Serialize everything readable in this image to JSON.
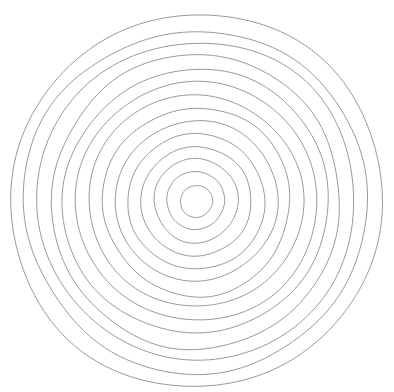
{
  "figure": {
    "background_color": "#ffffff",
    "stroke_color": "#9a9a9a",
    "stroke_width": 1,
    "canvas": {
      "width": 394,
      "height": 392
    }
  },
  "chart_data": {
    "type": "scatter",
    "subtitle": "",
    "xlabel": "",
    "ylabel": "",
    "xlim": [
      0,
      394
    ],
    "ylim": [
      0,
      392
    ],
    "grid": false,
    "legend": false,
    "legend_position": "none",
    "center": {
      "x": 196,
      "y": 201
    },
    "ring_count": 14,
    "radii": [
      16,
      29,
      42,
      55,
      68,
      81,
      94,
      107,
      120,
      133,
      146,
      159,
      172,
      186
    ],
    "roughness": 0.9,
    "series": [
      {
        "name": "rings",
        "values": [
          16,
          29,
          42,
          55,
          68,
          81,
          94,
          107,
          120,
          133,
          146,
          159,
          172,
          186
        ]
      }
    ],
    "annotations": []
  }
}
